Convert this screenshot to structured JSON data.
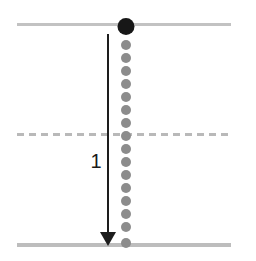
{
  "figure": {
    "title": "",
    "background_color": "#ffffff",
    "width": 256,
    "height": 261,
    "arrow_label": "1"
  },
  "chart_data": {
    "type": "scatter",
    "title": "",
    "xlabel": "",
    "ylabel": "",
    "xlim": [
      0,
      256
    ],
    "ylim": [
      0,
      261
    ],
    "grid": false,
    "legend": null,
    "annotations": [
      {
        "name": "displacement-arrow",
        "label": "1",
        "direction": "down",
        "x": 108,
        "y_start": 34,
        "y_end": 245,
        "color": "#1d1d1d",
        "label_x": 96,
        "label_y": 161
      }
    ],
    "reference_lines": [
      {
        "name": "top-boundary",
        "style": "solid",
        "y": 24,
        "x_start": 17,
        "x_end": 231,
        "color": "#c2c2c2",
        "thickness": 3
      },
      {
        "name": "mid-boundary",
        "style": "dashed",
        "y": 134,
        "x_start": 17,
        "x_end": 231,
        "color": "#b9b9b9",
        "thickness": 3,
        "dash": [
          7,
          5
        ]
      },
      {
        "name": "bottom-boundary",
        "style": "solid",
        "y": 245,
        "x_start": 17,
        "x_end": 231,
        "color": "#bdbdbd",
        "thickness": 4
      }
    ],
    "series": [
      {
        "name": "marker-highlight",
        "color": "#171717",
        "marker_size": 17,
        "points": [
          {
            "x": 126,
            "y": 26
          }
        ]
      },
      {
        "name": "marker-trail",
        "color": "#8c8c8c",
        "marker_size": 10,
        "points": [
          {
            "x": 126,
            "y": 45
          },
          {
            "x": 126,
            "y": 58
          },
          {
            "x": 126,
            "y": 71
          },
          {
            "x": 126,
            "y": 84
          },
          {
            "x": 126,
            "y": 97
          },
          {
            "x": 126,
            "y": 110
          },
          {
            "x": 126,
            "y": 123
          },
          {
            "x": 126,
            "y": 136
          },
          {
            "x": 126,
            "y": 149
          },
          {
            "x": 126,
            "y": 162
          },
          {
            "x": 126,
            "y": 175
          },
          {
            "x": 126,
            "y": 188
          },
          {
            "x": 126,
            "y": 201
          },
          {
            "x": 126,
            "y": 214
          },
          {
            "x": 126,
            "y": 227
          },
          {
            "x": 126,
            "y": 243
          }
        ]
      }
    ]
  }
}
